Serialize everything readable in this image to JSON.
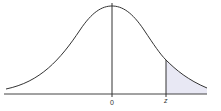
{
  "diagram": {
    "type": "standard-normal-distribution",
    "labels": {
      "center": "0",
      "critical": "z"
    },
    "shaded_region": "right-tail beyond z",
    "colors": {
      "curve": "#333333",
      "axis": "#444444",
      "shade": "#e8e8f4"
    }
  }
}
